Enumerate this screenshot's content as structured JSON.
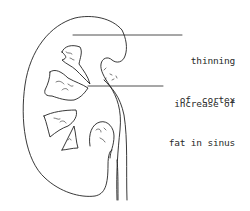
{
  "diagram": {
    "stroke_color": "#222222",
    "background": "#ffffff",
    "labels": [
      {
        "id": "thinning-of-cortex",
        "line1": "thinning",
        "line2": "of  cortex"
      },
      {
        "id": "increase-of-fat-in-sinus",
        "line1": "increase of",
        "line2": "fat in sinus"
      }
    ]
  }
}
